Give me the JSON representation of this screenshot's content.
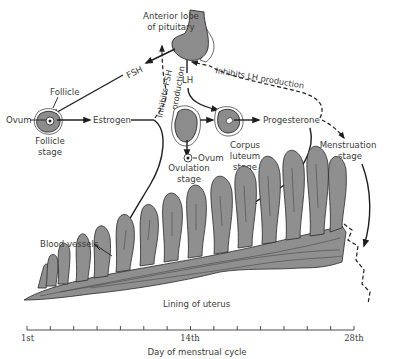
{
  "diagram": {
    "labels": {
      "pituitary": [
        "Anterior lobe",
        "of pituitary"
      ],
      "fsh": "FSH",
      "lh": "LH",
      "inhibits_fsh": [
        "Inhibits FSH",
        "production"
      ],
      "inhibits_lh": "Inhibits LH production",
      "follicle": "Follicle",
      "ovum_left": "Ovum",
      "follicle_stage": [
        "Follicle",
        "stage"
      ],
      "estrogen": "Estrogen",
      "ovum_ovulation": "Ovum",
      "ovulation_stage": [
        "Ovulation",
        "stage"
      ],
      "corpus_luteum_stage": [
        "Corpus",
        "luteum",
        "stage"
      ],
      "progesterone": "Progesterone",
      "menstruation_stage": [
        "Menstruation",
        "stage"
      ],
      "blood_vessels": "Blood vessels",
      "lining_of_uterus": "Lining of uterus"
    },
    "axis": {
      "start_label": "1st",
      "mid_label": "14th",
      "end_label": "28th",
      "title": "Day of menstrual cycle",
      "tick_count": 15
    },
    "colors": {
      "tissue": "#8f8f8f",
      "ink": "#1e1e1e",
      "text": "#3a3a3a",
      "background": "#ffffff"
    }
  }
}
